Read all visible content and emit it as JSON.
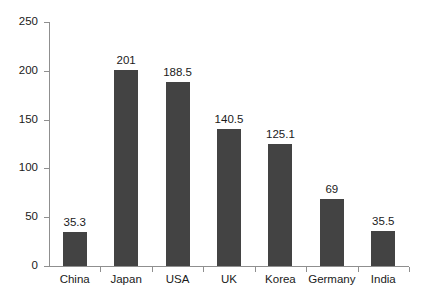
{
  "chart_data": {
    "type": "bar",
    "title": "",
    "subtitle": "",
    "xlabel": "",
    "ylabel": "",
    "categories": [
      "China",
      "Japan",
      "USA",
      "UK",
      "Korea",
      "Germany",
      "India"
    ],
    "values": [
      35.3,
      201,
      188.5,
      140.5,
      125.1,
      69,
      35.5
    ],
    "value_labels": [
      "35.3",
      "201",
      "188.5",
      "140.5",
      "125.1",
      "69",
      "35.5"
    ],
    "ylim": [
      0,
      250
    ],
    "yticks": [
      0,
      50,
      100,
      150,
      200,
      250
    ],
    "ytick_labels": [
      "0",
      "50",
      "100",
      "150",
      "200",
      "250"
    ],
    "grid": false,
    "legend": null,
    "bar_color": "#434343",
    "axis_color": "#8f8f8f",
    "text_color": "#1a1a1a",
    "background_color": "#ffffff"
  }
}
